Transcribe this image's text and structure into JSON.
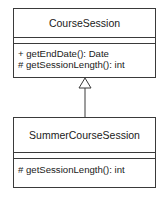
{
  "diagram": {
    "type": "uml-class-diagram",
    "classes": [
      {
        "name": "CourseSession",
        "attributes": [],
        "operations": [
          "+ getEndDate(): Date",
          "# getSessionLength(): int"
        ]
      },
      {
        "name": "SummerCourseSession",
        "attributes": [],
        "operations": [
          "# getSessionLength(): int"
        ]
      }
    ],
    "relationships": [
      {
        "type": "generalization",
        "from": "SummerCourseSession",
        "to": "CourseSession"
      }
    ]
  }
}
